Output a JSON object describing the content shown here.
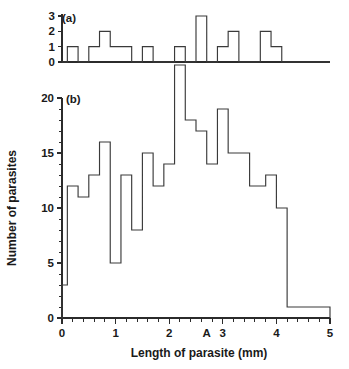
{
  "figure": {
    "caption_a": "(a)",
    "caption_b": "(b)",
    "xlabel": "Length of parasite (mm)",
    "ylabel": "Number of parasites",
    "line_color": "#3a3a3a",
    "axis_color": "#2b2b2b",
    "background": "#ffffff"
  },
  "chart_data": [
    {
      "type": "bar",
      "panel": "(a)",
      "title": "",
      "xlabel": "",
      "ylabel": "",
      "grid": false,
      "legend": null,
      "bin_width": 0.1,
      "xlim": [
        0,
        5
      ],
      "ylim": [
        0,
        3
      ],
      "yticks": [
        0,
        1,
        2,
        3
      ],
      "ytick_labels": [
        "0",
        "1",
        "2",
        "3"
      ],
      "xticks": [],
      "xtick_labels": [],
      "bin_starts": [
        0.0,
        0.1,
        0.2,
        0.3,
        0.4,
        0.5,
        0.6,
        0.7,
        0.8,
        0.9,
        1.0,
        1.1,
        1.2,
        1.3,
        1.4,
        1.5,
        1.6,
        1.7,
        1.8,
        1.9,
        2.0,
        2.1,
        2.2,
        2.3,
        2.4,
        2.5,
        2.6,
        2.7,
        2.8,
        2.9,
        3.0,
        3.1,
        3.2,
        3.3,
        3.4,
        3.5,
        3.6,
        3.7,
        3.8,
        3.9,
        4.0,
        4.1,
        4.2,
        4.3,
        4.4,
        4.5,
        4.6,
        4.7,
        4.8,
        4.9
      ],
      "values": [
        0,
        1,
        1,
        0,
        0,
        1,
        1,
        2,
        2,
        1,
        1,
        1,
        1,
        0,
        0,
        1,
        1,
        0,
        0,
        0,
        0,
        1,
        1,
        0,
        0,
        3,
        3,
        0,
        0,
        1,
        1,
        2,
        2,
        0,
        0,
        0,
        0,
        2,
        2,
        1,
        1,
        0,
        0,
        0,
        0,
        0,
        0,
        0,
        0,
        0
      ]
    },
    {
      "type": "bar",
      "panel": "(b)",
      "title": "",
      "xlabel": "Length of parasite (mm)",
      "ylabel": "Number of parasites",
      "grid": false,
      "legend": null,
      "bin_width": 0.1,
      "xlim": [
        0,
        5
      ],
      "ylim": [
        0,
        20
      ],
      "yticks": [
        0,
        5,
        10,
        15,
        20
      ],
      "ytick_labels": [
        "0",
        "5",
        "10",
        "15",
        "20"
      ],
      "yminor_step": 1,
      "xticks": [
        0,
        1,
        2,
        3,
        4,
        5
      ],
      "xtick_labels": [
        "0",
        "1",
        "2",
        "3",
        "4",
        "5"
      ],
      "xminor_step": 0.2,
      "annotations": [
        {
          "label": "A",
          "x": 2.7,
          "axis": "x"
        }
      ],
      "bin_starts": [
        0.0,
        0.1,
        0.2,
        0.3,
        0.4,
        0.5,
        0.6,
        0.7,
        0.8,
        0.9,
        1.0,
        1.1,
        1.2,
        1.3,
        1.4,
        1.5,
        1.6,
        1.7,
        1.8,
        1.9,
        2.0,
        2.1,
        2.2,
        2.3,
        2.4,
        2.5,
        2.6,
        2.7,
        2.8,
        2.9,
        3.0,
        3.1,
        3.2,
        3.3,
        3.4,
        3.5,
        3.6,
        3.7,
        3.8,
        3.9,
        4.0,
        4.1,
        4.2,
        4.3,
        4.4,
        4.5,
        4.6,
        4.7,
        4.8,
        4.9
      ],
      "values": [
        3,
        12,
        12,
        11,
        11,
        13,
        13,
        16,
        16,
        5,
        5,
        13,
        13,
        8,
        8,
        15,
        15,
        12,
        12,
        14,
        14,
        23,
        23,
        18,
        18,
        17,
        17,
        14,
        14,
        19,
        19,
        15,
        15,
        15,
        15,
        12,
        12,
        12,
        13,
        13,
        10,
        10,
        1,
        1,
        1,
        1,
        1,
        1,
        1,
        1
      ]
    }
  ]
}
